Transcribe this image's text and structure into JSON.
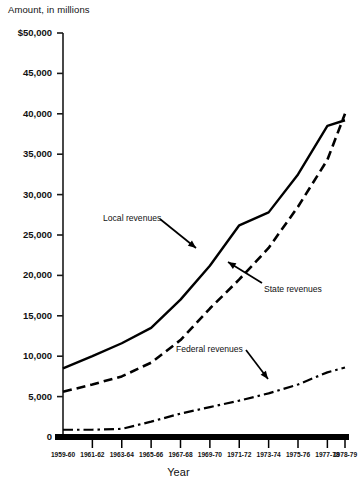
{
  "chart_data": {
    "type": "line",
    "title": "",
    "ylabel": "Amount, in millions",
    "xlabel": "Year",
    "ylim": [
      0,
      50000
    ],
    "ytick_labels": [
      "$50,000",
      "45,000",
      "40,000",
      "35,000",
      "30,000",
      "25,000",
      "20,000",
      "15,000",
      "10,000",
      "5,000",
      "0"
    ],
    "ytick_values": [
      50000,
      45000,
      40000,
      35000,
      30000,
      25000,
      20000,
      15000,
      10000,
      5000,
      0
    ],
    "grid": false,
    "legend": "inline-annotations",
    "categories": [
      "1959-60",
      "1961-62",
      "1963-64",
      "1965-66",
      "1967-68",
      "1969-70",
      "1971-72",
      "1973-74",
      "1975-76",
      "1977-78",
      "1978-79"
    ],
    "series": [
      {
        "name": "Local revenues",
        "style": "solid",
        "values": [
          8500,
          10000,
          11600,
          13500,
          17000,
          21200,
          26200,
          27800,
          32500,
          38500,
          39200
        ]
      },
      {
        "name": "State revenues",
        "style": "dashed",
        "values": [
          5600,
          6500,
          7500,
          9200,
          12000,
          15900,
          19500,
          23400,
          28500,
          34300,
          40000
        ]
      },
      {
        "name": "Federal revenues",
        "style": "dash-dot",
        "values": [
          900,
          900,
          1000,
          1900,
          2900,
          3700,
          4500,
          5400,
          6500,
          8000,
          8600
        ]
      }
    ],
    "annotations": [
      {
        "text": "Local revenues",
        "target_series": "Local revenues"
      },
      {
        "text": "State revenues",
        "target_series": "State revenues"
      },
      {
        "text": "Federal revenues",
        "target_series": "Federal revenues"
      }
    ],
    "colors": {
      "line": "#000000",
      "background": "#ffffff",
      "text": "#111111"
    }
  }
}
